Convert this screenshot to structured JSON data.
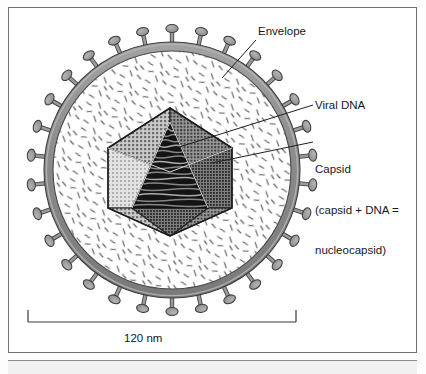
{
  "figure": {
    "title_visible": false,
    "diagram_type": "enveloped-virus-cross-section",
    "background_color": "#ffffff",
    "frame_color": "#6f6f6f"
  },
  "labels": {
    "envelope": "Envelope",
    "viral_dna": "Viral DNA",
    "capsid_line1": "Capsid",
    "capsid_line2": "(capsid + DNA =",
    "capsid_line3": "nucleocapsid)"
  },
  "scale_bar": {
    "value": "120 nm",
    "measures": "overall virion diameter"
  },
  "caption": {
    "text": "",
    "note": "cut off at bottom edge"
  },
  "colors": {
    "envelope_fill": "#8f8f8f",
    "envelope_stroke": "#3a3a3a",
    "spike_fill": "#9a9a9a",
    "spike_stroke": "#3f3f3f",
    "tegument_fill": "#ffffff",
    "tegument_dash": "#5e5e5e",
    "capsid_light": "#d7d7d7",
    "capsid_mid": "#a8a8a8",
    "capsid_dark": "#6e6e6e",
    "dna_dark": "#1d1d1d",
    "leader_line": "#1f1f1f",
    "text": "#16181a"
  },
  "structures": {
    "envelope": {
      "center_x": 172,
      "center_y": 170,
      "outer_radius": 128,
      "ring_thickness": 9,
      "spike_count": 30
    },
    "capsid": {
      "center_x": 170,
      "center_y": 172,
      "radius": 64,
      "shape": "icosahedron"
    },
    "viral_dna": {
      "description": "coiled dark genome visible through open capsid facet"
    }
  }
}
